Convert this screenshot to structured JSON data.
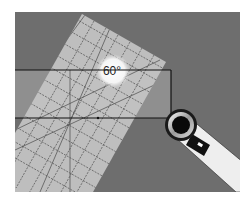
{
  "illustration": {
    "subject": "Quilting ruler aligned on fabric strip with rotary cutter",
    "angle_label": "60°",
    "colors": {
      "background": "#ffffff",
      "mat": "#6e6e6e",
      "fabric_strip": "#8f8f8f",
      "ruler": "#c4c4c4",
      "ruler_lines": "#555555",
      "highlight": "#f2f2f2",
      "cutter_handle": "#eeeeee",
      "cutter_dark": "#111111"
    }
  }
}
